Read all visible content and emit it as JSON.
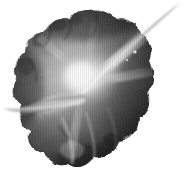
{
  "image": {
    "title": "Grayscale lobed organic form with luminous core",
    "subject": "flower-like cloud form",
    "width": 184,
    "height": 179,
    "background_color": "#ffffff",
    "colorspace": "grayscale",
    "texture": "fine vertical scanline striping",
    "alt_text": "A monochrome cloud-like scalloped mass with a bright glowing center, a long thin tendril sweeping to the upper right and a shorter tendril to the left, on a white background."
  },
  "palette": {
    "background": "#ffffff",
    "darkest": "#111111",
    "dark": "#2e2e2e",
    "mid_dark": "#4a4a4a",
    "mid": "#6f6f6f",
    "mid_light": "#9a9a9a",
    "light": "#c8c8c8",
    "highlight": "#f2f2f2",
    "core_glow": "#ffffff"
  },
  "composition": {
    "core_glow": {
      "cx": 82,
      "cy": 78,
      "r": 34
    },
    "main_mass": {
      "label": "scalloped cloud body",
      "bounds": {
        "x": 10,
        "y": 12,
        "width": 140,
        "height": 158
      }
    },
    "lobes": [
      {
        "name": "upper-left-lobe",
        "cx": 46,
        "cy": 48,
        "tone": "#3a3a3a"
      },
      {
        "name": "top-lobe",
        "cx": 82,
        "cy": 28,
        "tone": "#2b2b2b"
      },
      {
        "name": "upper-right-lobe",
        "cx": 120,
        "cy": 52,
        "tone": "#353535"
      },
      {
        "name": "left-lobe",
        "cx": 28,
        "cy": 82,
        "tone": "#404040"
      },
      {
        "name": "right-lobe",
        "cx": 136,
        "cy": 96,
        "tone": "#262626"
      },
      {
        "name": "lower-left-lobe",
        "cx": 60,
        "cy": 130,
        "tone": "#5c5c5c"
      },
      {
        "name": "bottom-lobe",
        "cx": 96,
        "cy": 150,
        "tone": "#3c3c3c"
      },
      {
        "name": "lower-right-lobe",
        "cx": 128,
        "cy": 134,
        "tone": "#1d1d1d"
      }
    ],
    "tendrils": [
      {
        "name": "upper-right-tendril",
        "from": {
          "x": 86,
          "y": 88
        },
        "to": {
          "x": 179,
          "y": 4
        },
        "tone": "#d8d8d8",
        "thickness_max": 11
      },
      {
        "name": "left-tendril",
        "from": {
          "x": 78,
          "y": 96
        },
        "to": {
          "x": 4,
          "y": 108
        },
        "tone": "#bdbdbd",
        "thickness_max": 6
      }
    ],
    "light_streaks": [
      {
        "name": "streak-ne",
        "angle_deg": -42,
        "tone": "#efefef"
      },
      {
        "name": "streak-e",
        "angle_deg": -8,
        "tone": "#dcdcdc"
      },
      {
        "name": "streak-sw",
        "angle_deg": 200,
        "tone": "#cfcfcf"
      },
      {
        "name": "streak-s",
        "angle_deg": 104,
        "tone": "#b4b4b4"
      }
    ]
  }
}
